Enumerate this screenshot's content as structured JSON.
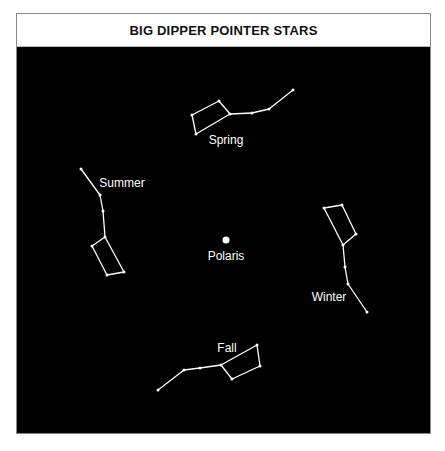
{
  "title": "BIG DIPPER POINTER STARS",
  "colors": {
    "background": "#000000",
    "line": "#ffffff",
    "title_bg": "#ffffff"
  },
  "center": {
    "label": "Polaris",
    "x": 226,
    "y": 240
  },
  "constellations": [
    {
      "season": "Spring",
      "label_pos": [
        226,
        144
      ],
      "stars": [
        [
          293,
          90
        ],
        [
          269,
          109
        ],
        [
          252,
          113
        ],
        [
          230,
          114
        ],
        [
          219,
          101
        ],
        [
          192,
          115
        ],
        [
          196,
          134
        ]
      ],
      "edges": [
        [
          0,
          1
        ],
        [
          1,
          2
        ],
        [
          2,
          3
        ],
        [
          3,
          4
        ],
        [
          4,
          5
        ],
        [
          5,
          6
        ],
        [
          6,
          3
        ]
      ]
    },
    {
      "season": "Summer",
      "label_pos": [
        122,
        187
      ],
      "stars": [
        [
          81,
          169
        ],
        [
          100,
          195
        ],
        [
          103,
          211
        ],
        [
          105,
          237
        ],
        [
          92,
          246
        ],
        [
          107,
          275
        ],
        [
          124,
          272
        ]
      ],
      "edges": [
        [
          0,
          1
        ],
        [
          1,
          2
        ],
        [
          2,
          3
        ],
        [
          3,
          4
        ],
        [
          4,
          5
        ],
        [
          5,
          6
        ],
        [
          6,
          3
        ]
      ]
    },
    {
      "season": "Winter",
      "label_pos": [
        329,
        301
      ],
      "stars": [
        [
          367,
          312
        ],
        [
          348,
          284
        ],
        [
          345,
          267
        ],
        [
          343,
          245
        ],
        [
          356,
          234
        ],
        [
          342,
          205
        ],
        [
          324,
          208
        ]
      ],
      "edges": [
        [
          0,
          1
        ],
        [
          1,
          2
        ],
        [
          2,
          3
        ],
        [
          3,
          4
        ],
        [
          4,
          5
        ],
        [
          5,
          6
        ],
        [
          6,
          3
        ]
      ]
    },
    {
      "season": "Fall",
      "label_pos": [
        227,
        352
      ],
      "stars": [
        [
          158,
          390
        ],
        [
          184,
          370
        ],
        [
          200,
          368
        ],
        [
          221,
          365
        ],
        [
          257,
          345
        ],
        [
          260,
          366
        ],
        [
          232,
          379
        ]
      ],
      "edges": [
        [
          0,
          1
        ],
        [
          1,
          2
        ],
        [
          2,
          3
        ],
        [
          3,
          4
        ],
        [
          4,
          5
        ],
        [
          5,
          6
        ],
        [
          6,
          3
        ]
      ]
    }
  ]
}
